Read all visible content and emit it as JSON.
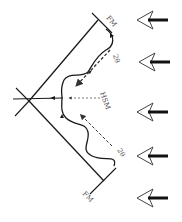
{
  "diagram": {
    "labels": {
      "fm_top": "FM",
      "fm_bottom": "FM",
      "two_theta_top": "2θ",
      "two_theta_bottom": "2θ",
      "hsm": "HSM"
    },
    "incoming_arrows": {
      "count": 5,
      "direction": "left",
      "y_positions": [
        20,
        62,
        112,
        156,
        198
      ]
    },
    "colors": {
      "line": "#1a1a1a",
      "label": "#555555",
      "dashed": "#333333",
      "background": "#ffffff"
    }
  }
}
